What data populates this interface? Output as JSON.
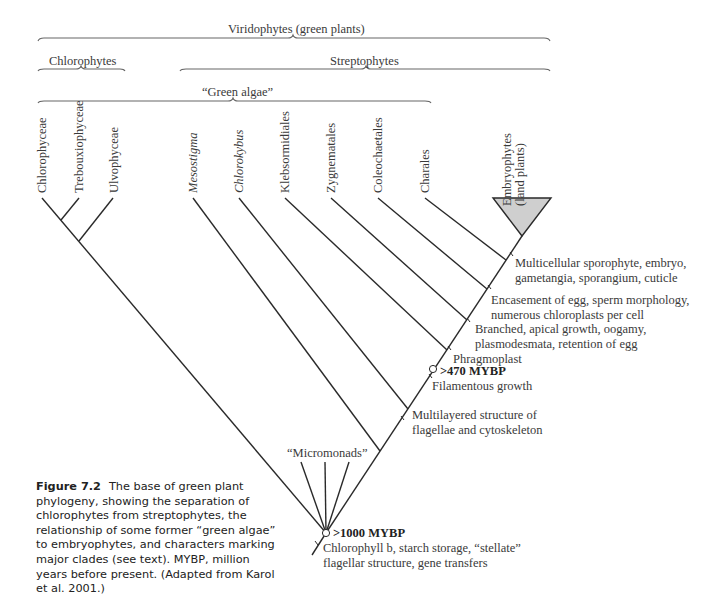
{
  "brackets": {
    "viridophytes": "Viridophytes (green plants)",
    "chlorophytes": "Chlorophytes",
    "streptophytes": "Streptophytes",
    "green_algae": "“Green algae”"
  },
  "taxa": {
    "chlorophyceae": "Chlorophyceae",
    "trebouxiophyceae": "Trebouxiophyceae",
    "ulvophyceae": "Ulvophyceae",
    "mesostigma": "Mesostigma",
    "chlorokybus": "Chlorokybus",
    "klebsormidiales": "Klebsormidiales",
    "zygnematales": "Zygnematales",
    "coleochaetales": "Coleochaetales",
    "charales": "Charales",
    "embryophytes_line1": "Embryophytes",
    "embryophytes_line2": "(land plants)",
    "micromonads": "“Micromonads”"
  },
  "characters": {
    "c1_line1": "Multicellular sporophyte, embryo,",
    "c1_line2": "gametangia, sporangium, cuticle",
    "c2_line1": "Encasement of egg, sperm morphology,",
    "c2_line2": "numerous chloroplasts per cell",
    "c3_line1": "Branched, apical growth, oogamy,",
    "c3_line2": "plasmodesmata, retention of egg",
    "c4": "Phragmoplast",
    "c5": "Filamentous growth",
    "c6_line1": "Multilayered structure of",
    "c6_line2": "flagellae and cytoskeleton",
    "root_line1": "Chlorophyll b, starch storage, “stellate”",
    "root_line2": "flagellar structure, gene transfers"
  },
  "dates": {
    "node_470": ">470 MYBP",
    "node_1000": ">1000 MYBP"
  },
  "caption": {
    "figure_label": "Figure 7.2",
    "text": "The base of green plant phylogeny, showing the separation of chlorophytes from streptophytes, the relationship of some former “green algae” to embryophytes, and characters marking major clades (see text). MYBP, million years before present. (Adapted from Karol et al. 2001.)"
  },
  "colors": {
    "line": "#2a2a2a",
    "bracket": "#555555",
    "triangle_fill": "#cfcfcf"
  }
}
